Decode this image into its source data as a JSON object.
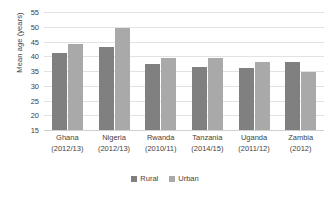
{
  "chart_data": {
    "type": "bar",
    "title": "",
    "xlabel": "",
    "ylabel": "Mean age (years)",
    "ylim": [
      15,
      55
    ],
    "ytick_step": 5,
    "yticks": [
      55,
      50,
      45,
      40,
      35,
      30,
      25,
      20,
      15
    ],
    "grid": true,
    "legend_position": "bottom",
    "categories": [
      "Ghana",
      "Nigeria",
      "Rwanda",
      "Tanzania",
      "Uganda",
      "Zambia"
    ],
    "category_periods": [
      "(2012/13)",
      "(2012/13)",
      "(2010/11)",
      "(2014/15)",
      "(2011/12)",
      "(2012)"
    ],
    "series": [
      {
        "name": "Rural",
        "color": "#808080",
        "values": [
          41,
          43,
          37.5,
          36.5,
          36,
          38
        ]
      },
      {
        "name": "Urban",
        "color": "#a9a9a9",
        "values": [
          44,
          49.5,
          39.5,
          39.5,
          38,
          34.5
        ]
      }
    ]
  }
}
